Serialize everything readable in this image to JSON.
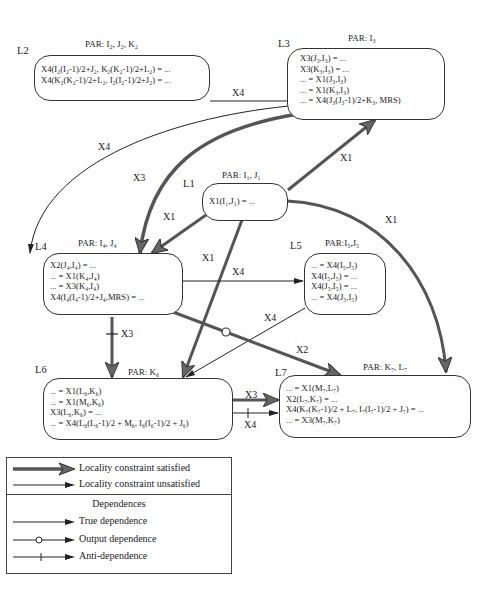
{
  "nodes": {
    "L1": {
      "label": "L1",
      "par": "PAR: I₁, J₁",
      "lines": [
        "X1(I₁,J₁) = ..."
      ]
    },
    "L2": {
      "label": "L2",
      "par": "PAR: I₂, J₂, K₂",
      "lines": [
        "X4(I₂(I₂-1)/2+J₂, K₂(K₂-1)/2+L₂) = ...",
        "X4(K₂(K₂-1)/2+L₂, I₂(I₂-1)/2+J₂) = ..."
      ]
    },
    "L3": {
      "label": "L3",
      "par": "PAR: I₃",
      "lines": [
        "X3(J₃,I₃) = ...",
        "X3(K₃,I₃) = ...",
        "... = X1(J₃,I₃)",
        "... = X1(K₃,I₃)",
        "... = X4(J₃(J₃-1)/2+K₃, MRS)"
      ]
    },
    "L4": {
      "label": "L4",
      "par": "PAR: I₄, J₄",
      "lines": [
        "X2(J₄,I₄) = ...",
        "... = X1(K₄,J₄)",
        "... = X3(K₄,I₄)",
        "X4(I₄(I₄-1)/2+J₄,MRS) = ..."
      ]
    },
    "L5": {
      "label": "L5",
      "par": "PAR:I₅,J₅",
      "lines": [
        "... = X4(I₅,J₅)",
        "X4(I₅,J₅) = ...",
        "X4(J₅,I₅) = ...",
        "... = X4(J₅,I₅)"
      ]
    },
    "L6": {
      "label": "L6",
      "par": "PAR: K₆",
      "lines": [
        "... = X1(L₆,K₆)",
        "... = X1(M₆,K₆)",
        "X3(L₆,K₆) = ...",
        "... = X4(L₆(L₆-1)/2 + M₆, I₆(I₆-1)/2 + J₆)"
      ]
    },
    "L7": {
      "label": "L7",
      "par": "PAR: K₇, L₇",
      "lines": [
        "... = X1(M₇,L₇)",
        "X2(L₇,K₇) = ...",
        "X4(K₇(K₇-1)/2 + L₇, I₇(I₇-1)/2 + J₇) = ...",
        "... = X3(M₇,K₇)"
      ]
    }
  },
  "edges": [
    {
      "from": "L2",
      "to": "L3",
      "label": "X4",
      "locality": "unsatisfied",
      "dependence": "true"
    },
    {
      "from": "L2",
      "to": "L4",
      "label": "X4",
      "locality": "unsatisfied",
      "dependence": "true"
    },
    {
      "from": "L3",
      "to": "L4",
      "label": "X3",
      "locality": "satisfied",
      "dependence": "true"
    },
    {
      "from": "L1",
      "to": "L3",
      "label": "X1",
      "locality": "satisfied",
      "dependence": "true"
    },
    {
      "from": "L1",
      "to": "L4",
      "label": "X1",
      "locality": "satisfied",
      "dependence": "true"
    },
    {
      "from": "L1",
      "to": "L6",
      "label": "X1",
      "locality": "satisfied",
      "dependence": "true"
    },
    {
      "from": "L1",
      "to": "L7",
      "label": "X1",
      "locality": "satisfied",
      "dependence": "true"
    },
    {
      "from": "L4",
      "to": "L5",
      "label": "X4",
      "locality": "unsatisfied",
      "dependence": "true"
    },
    {
      "from": "L5",
      "to": "L6",
      "label": "X4",
      "locality": "unsatisfied",
      "dependence": "true"
    },
    {
      "from": "L4",
      "to": "L6",
      "label": "X3",
      "locality": "satisfied",
      "dependence": "anti"
    },
    {
      "from": "L4",
      "to": "L7",
      "label": "X2",
      "locality": "satisfied",
      "dependence": "output"
    },
    {
      "from": "L6",
      "to": "L7",
      "label": "X3",
      "locality": "satisfied",
      "dependence": "true"
    },
    {
      "from": "L6",
      "to": "L7",
      "label": "X4",
      "locality": "unsatisfied",
      "dependence": "anti"
    }
  ],
  "edge_labels": {
    "l2_l3": "X4",
    "l2_l4": "X4",
    "l3_l4": "X3",
    "l1_l3": "X1",
    "l1_l4": "X1",
    "l1_l6": "X1",
    "l1_l7": "X1",
    "l4_l5": "X4",
    "l5_l6": "X4",
    "l4_l6": "X3",
    "l4_l7": "X2",
    "l6_l7_a": "X3",
    "l6_l7_b": "X4"
  },
  "legend": {
    "locality": [
      {
        "style": "thick",
        "label": "Locality constraint satisfied"
      },
      {
        "style": "thin",
        "label": "Locality constraint unsatisfied"
      }
    ],
    "dependences_title": "Dependences",
    "dependences": [
      {
        "style": "true",
        "label": "True dependence"
      },
      {
        "style": "output",
        "label": "Output dependence"
      },
      {
        "style": "anti",
        "label": "Anti-dependence"
      }
    ]
  }
}
